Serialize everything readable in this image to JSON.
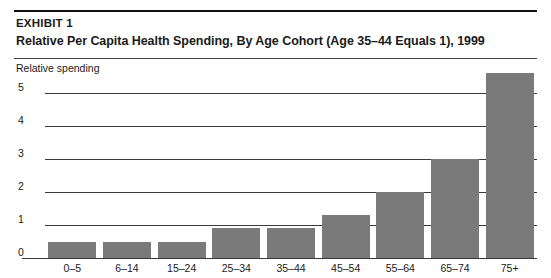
{
  "exhibit": {
    "label": "EXHIBIT 1",
    "title": "Relative Per Capita Health Spending, By Age Cohort (Age 35–44 Equals 1), 1999"
  },
  "chart_data": {
    "type": "bar",
    "title": "Relative Per Capita Health Spending, By Age Cohort (Age 35–44 Equals 1), 1999",
    "xlabel": "",
    "ylabel": "Relative spending",
    "categories": [
      "0–5",
      "6–14",
      "15–24",
      "25–34",
      "35–44",
      "45–54",
      "55–64",
      "65–74",
      "75+"
    ],
    "values": [
      0.5,
      0.5,
      0.5,
      0.9,
      0.9,
      1.3,
      2.0,
      3.0,
      5.6
    ],
    "ylim": [
      0,
      5.8
    ],
    "yticks": [
      0,
      1,
      2,
      3,
      4,
      5
    ],
    "ytick_labels": [
      "0",
      "1",
      "2",
      "3",
      "4",
      "5"
    ],
    "grid": true,
    "legend": false,
    "bar_color": "#7a7a7a"
  },
  "colors": {
    "bar": "#7a7a7a",
    "rule": "#111111",
    "gridline": "#3a3a3a",
    "text": "#1a1a1a",
    "background": "#ffffff"
  }
}
